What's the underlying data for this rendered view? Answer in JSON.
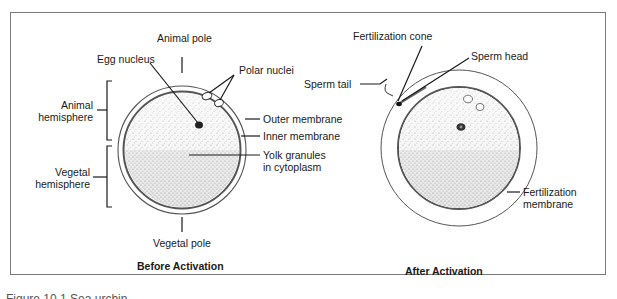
{
  "figure": {
    "caption_partial": "Figure 10.1  Sea urchin",
    "panels": [
      {
        "title": "Before Activation",
        "labels": {
          "animal_pole": "Animal pole",
          "egg_nucleus": "Egg nucleus",
          "polar_nuclei": "Polar nuclei",
          "animal_hemisphere_1": "Animal",
          "animal_hemisphere_2": "hemisphere",
          "vegetal_hemisphere_1": "Vegetal",
          "vegetal_hemisphere_2": "hemisphere",
          "outer_membrane": "Outer membrane",
          "inner_membrane": "Inner membrane",
          "yolk_1": "Yolk granules",
          "yolk_2": "in cytoplasm",
          "vegetal_pole": "Vegetal pole"
        }
      },
      {
        "title": "After Activation",
        "labels": {
          "fertilization_cone": "Fertilization cone",
          "sperm_head": "Sperm head",
          "sperm_tail": "Sperm tail",
          "fertilization_membrane_1": "Fertilization",
          "fertilization_membrane_2": "membrane"
        }
      }
    ]
  },
  "colors": {
    "line": "#1a1a1a",
    "membrane": "#555555",
    "cytoplasm": "#ececec",
    "frame": "#7a7a7a"
  }
}
